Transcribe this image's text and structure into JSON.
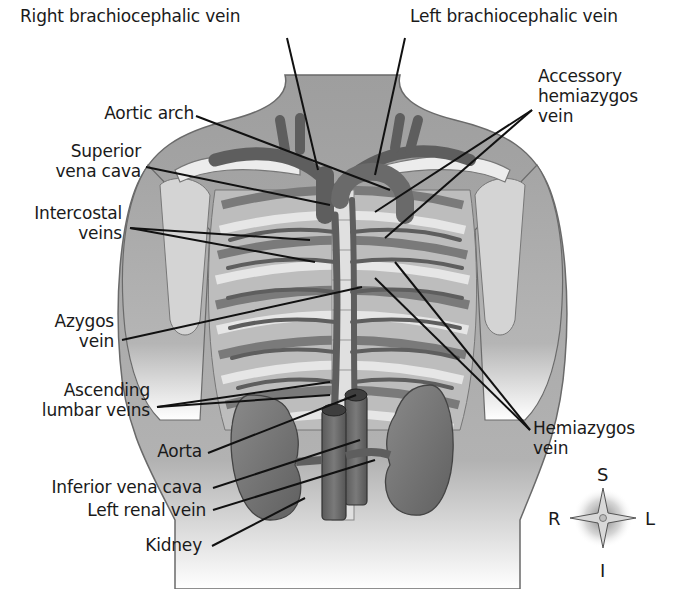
{
  "figure": {
    "colors": {
      "skin": "#a9a9a9",
      "skin_light": "#c8c8c8",
      "vessel": "#6e6e6e",
      "vessel_dark": "#4a4a4a",
      "rib_dark": "#7a7a7a",
      "rib_light": "#e6e6e6",
      "bone": "#ececec",
      "kidney": "#7d7d7d",
      "leader": "#111111",
      "text": "#1a1a1a"
    }
  },
  "labels": {
    "right_brachiocephalic_vein": "Right brachiocephalic vein",
    "left_brachiocephalic_vein": "Left brachiocephalic vein",
    "accessory_hemiazygos_vein_1": "Accessory",
    "accessory_hemiazygos_vein_2": "hemiazygos",
    "accessory_hemiazygos_vein_3": "vein",
    "aortic_arch": "Aortic arch",
    "superior_vena_cava_1": "Superior",
    "superior_vena_cava_2": "vena cava",
    "intercostal_veins_1": "Intercostal",
    "intercostal_veins_2": "veins",
    "azygos_vein_1": "Azygos",
    "azygos_vein_2": "vein",
    "ascending_lumbar_veins_1": "Ascending",
    "ascending_lumbar_veins_2": "lumbar veins",
    "aorta": "Aorta",
    "inferior_vena_cava": "Inferior vena cava",
    "left_renal_vein": "Left renal vein",
    "kidney": "Kidney",
    "hemiazygos_vein_1": "Hemiazygos",
    "hemiazygos_vein_2": "vein"
  },
  "compass": {
    "superior": "S",
    "inferior": "I",
    "right": "R",
    "left": "L"
  }
}
